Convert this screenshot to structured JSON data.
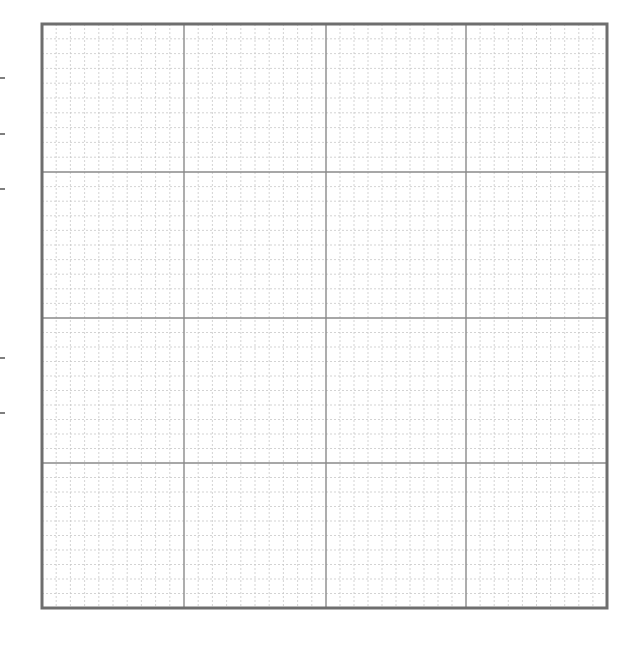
{
  "page": {
    "width": 639,
    "height": 660,
    "background": "#ffffff"
  },
  "grid": {
    "left": 42,
    "top": 24,
    "right": 607,
    "bottom": 608,
    "major_x": [
      42,
      184,
      326,
      466,
      607
    ],
    "major_y": [
      24,
      172,
      318,
      463,
      608
    ],
    "minor_divisions_per_cell": 10,
    "border_color": "#6e6e6e",
    "border_width": 3,
    "major_color": "#8a8a8a",
    "major_width": 1.4,
    "minor_color": "#c8c8c8",
    "minor_width": 0.8,
    "minor_dash": "2,2"
  },
  "margin_ticks": {
    "x1": 0,
    "x2": 5,
    "y": [
      78,
      134,
      189,
      358,
      413
    ],
    "color": "#555555",
    "width": 1.5
  }
}
